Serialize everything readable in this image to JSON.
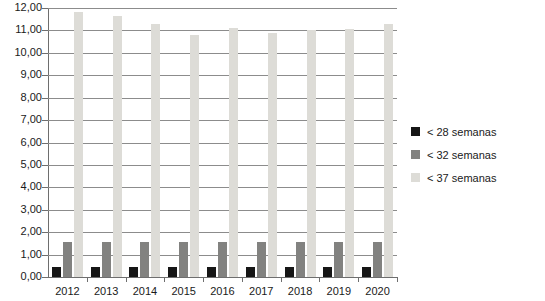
{
  "chart_data": {
    "type": "bar",
    "title": "",
    "subtitle": "",
    "xlabel": "",
    "ylabel": "",
    "categories": [
      "2012",
      "2013",
      "2014",
      "2015",
      "2016",
      "2017",
      "2018",
      "2019",
      "2020"
    ],
    "series": [
      {
        "name": "< 28 semanas",
        "color": "#161616",
        "values": [
          0.45,
          0.45,
          0.45,
          0.45,
          0.45,
          0.45,
          0.45,
          0.45,
          0.45
        ]
      },
      {
        "name": "< 32 semanas",
        "color": "#828280",
        "values": [
          1.55,
          1.55,
          1.55,
          1.55,
          1.55,
          1.55,
          1.55,
          1.55,
          1.55
        ]
      },
      {
        "name": "< 37 semanas",
        "color": "#dddcd7",
        "values": [
          11.8,
          11.65,
          11.3,
          10.8,
          11.1,
          10.9,
          11.0,
          11.05,
          11.3
        ]
      }
    ],
    "ylim": [
      0,
      12
    ],
    "ytick_step": 1,
    "ytick_labels": [
      "0,00",
      "1,00",
      "2,00",
      "3,00",
      "4,00",
      "5,00",
      "6,00",
      "7,00",
      "8,00",
      "9,00",
      "10,00",
      "11,00",
      "12,00"
    ],
    "grid": true,
    "grid_axis": "y",
    "legend_position": "right",
    "decimal_separator": ","
  },
  "legend": {
    "items": [
      {
        "label": "< 28 semanas"
      },
      {
        "label": "< 32 semanas"
      },
      {
        "label": "< 37 semanas"
      }
    ]
  }
}
